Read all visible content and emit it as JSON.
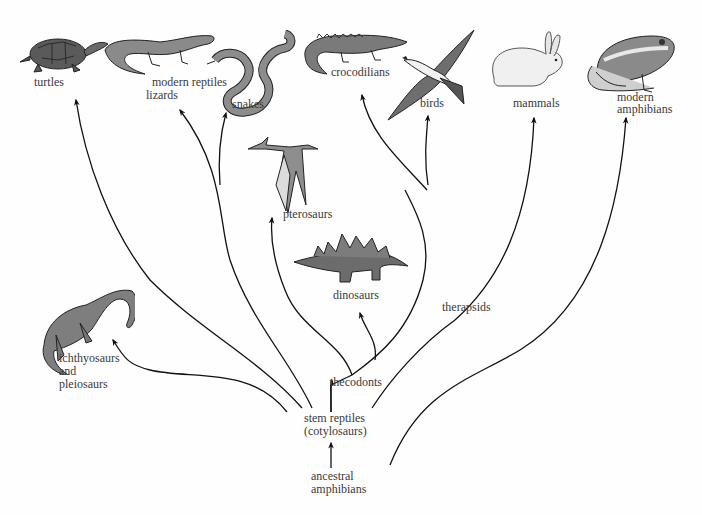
{
  "diagram": {
    "root": {
      "label_line1": "ancestral",
      "label_line2": "amphibians"
    },
    "stem": {
      "label_line1": "stem reptiles",
      "label_line2": "(cotylosaurs)"
    },
    "intermediate": {
      "thecodonts": "thecodonts",
      "therapsids": "therapsids"
    },
    "extinct_groups": {
      "ichthyosaurs_line1": "ichthyosaurs",
      "ichthyosaurs_line2": "and",
      "ichthyosaurs_line3": "pleiosaurs",
      "pterosaurs": "pterosaurs",
      "dinosaurs": "dinosaurs"
    },
    "modern_groups": {
      "turtles": "turtles",
      "modern_reptiles": "modern reptiles",
      "lizards": "lizards",
      "snakes": "snakes",
      "crocodilians": "crocodilians",
      "birds": "birds",
      "mammals": "mammals",
      "modern_amphibians_line1": "modern",
      "modern_amphibians_line2": "amphibians"
    },
    "edges": [
      {
        "from": "ancestral amphibians",
        "to": "stem reptiles (cotylosaurs)"
      },
      {
        "from": "ancestral amphibians",
        "to": "modern amphibians"
      },
      {
        "from": "stem reptiles (cotylosaurs)",
        "to": "ichthyosaurs and pleiosaurs"
      },
      {
        "from": "stem reptiles (cotylosaurs)",
        "to": "turtles"
      },
      {
        "from": "stem reptiles (cotylosaurs)",
        "to": "lizards"
      },
      {
        "from": "stem reptiles (cotylosaurs)",
        "to": "snakes"
      },
      {
        "from": "stem reptiles (cotylosaurs)",
        "to": "thecodonts"
      },
      {
        "from": "stem reptiles (cotylosaurs)",
        "to": "therapsids"
      },
      {
        "from": "thecodonts",
        "to": "pterosaurs"
      },
      {
        "from": "thecodonts",
        "to": "dinosaurs"
      },
      {
        "from": "thecodonts",
        "to": "crocodilians"
      },
      {
        "from": "thecodonts",
        "to": "birds"
      },
      {
        "from": "therapsids",
        "to": "mammals"
      }
    ],
    "icons": [
      "turtle-illustration",
      "lizard-illustration",
      "snake-illustration",
      "crocodile-illustration",
      "bird-illustration",
      "rabbit-illustration",
      "frog-illustration",
      "pterosaur-illustration",
      "stegosaurus-illustration",
      "plesiosaur-illustration"
    ]
  }
}
